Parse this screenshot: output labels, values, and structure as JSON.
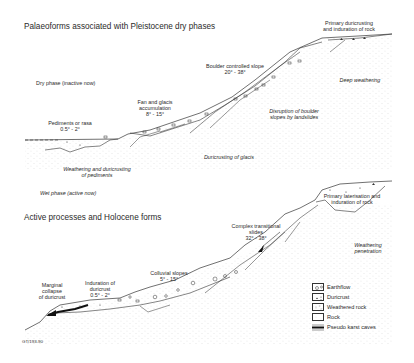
{
  "top_panel": {
    "title": "Palaeoforms associated with Pleistocene dry phases",
    "phase_label": "Dry phase (inactive now)",
    "labels": {
      "pediments": "Pediments or rasa",
      "pediments_angle": "0.5° - 2°",
      "fan": "Fan and glacis",
      "fan2": "accumulation",
      "fan_angle": "8° - 15°",
      "boulder": "Boulder controlled slope",
      "boulder_angle": "20° - 38°",
      "primary1": "Primary duricrusting",
      "primary2": "and induration of rock",
      "deep": "Deep weathering",
      "disruption1": "Disruption of boulder",
      "disruption2": "slopes by landslides",
      "glacis": "Duricrusting of glacis",
      "weathering1": "Weathering and duricrusting",
      "weathering2": "of pediments"
    }
  },
  "bottom_panel": {
    "phase_label": "Wet phase (active now)",
    "title": "Active processes and Holocene forms",
    "labels": {
      "marginal1": "Marginal",
      "marginal2": "collapse",
      "marginal3": "of duricrust",
      "induration1": "Induration of",
      "induration2": "duricrust",
      "induration_angle": "0.5° - 2°",
      "colluvial": "Colluvial slopes",
      "colluvial_angle": "5° - 15°",
      "complex1": "Complex transitional",
      "complex2": "slides",
      "complex_angle": "32° - 38°",
      "lateris1": "Primary laterisation and",
      "lateris2": "induration of rock",
      "penetration1": "Weathering",
      "penetration2": "penetration"
    }
  },
  "legend": {
    "items": [
      {
        "label": "Earthflow",
        "pattern": "circles"
      },
      {
        "label": "Duricrust",
        "pattern": "triangles"
      },
      {
        "label": "Weathered rock",
        "pattern": "sparse-dots"
      },
      {
        "label": "Rock",
        "pattern": "plain"
      },
      {
        "label": "Pseudo karst caves",
        "pattern": "black-bar"
      }
    ]
  },
  "figure_code": "GT/193-90"
}
